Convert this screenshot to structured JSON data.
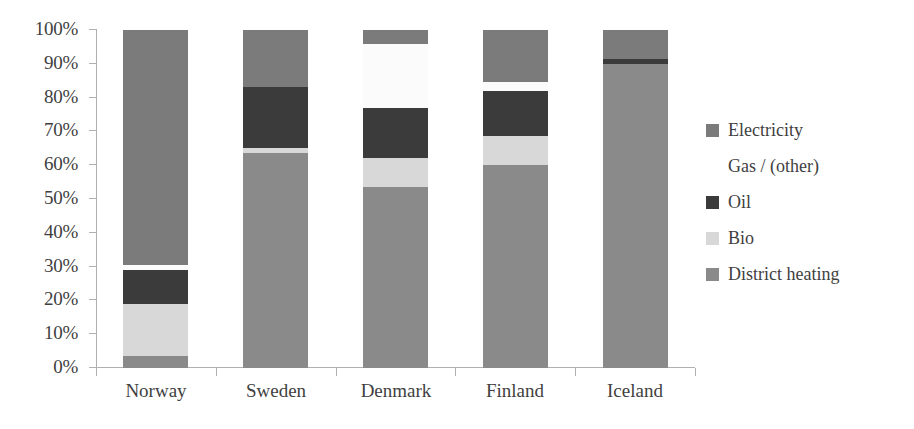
{
  "chart_data": {
    "type": "bar",
    "subtype": "stacked-percentage",
    "title": "",
    "subtitle": "",
    "xlabel": "",
    "ylabel": "",
    "ylim": [
      0,
      100
    ],
    "grid": false,
    "legend_position": "right",
    "categories": [
      "Norway",
      "Sweden",
      "Denmark",
      "Finland",
      "Iceland"
    ],
    "y_ticks": [
      "0%",
      "10%",
      "20%",
      "30%",
      "40%",
      "50%",
      "60%",
      "70%",
      "80%",
      "90%",
      "100%"
    ],
    "y_tick_values": [
      0,
      10,
      20,
      30,
      40,
      50,
      60,
      70,
      80,
      90,
      100
    ],
    "series": [
      {
        "name": "District heating",
        "color": "#8a8a8a",
        "values": [
          3.5,
          63.5,
          53.5,
          60.0,
          90.0
        ]
      },
      {
        "name": "Bio",
        "color": "#d8d8d8",
        "values": [
          15.5,
          1.5,
          8.5,
          8.5,
          0.0
        ]
      },
      {
        "name": "Oil",
        "color": "#3b3b3b",
        "values": [
          10.0,
          18.0,
          15.0,
          13.5,
          1.5
        ]
      },
      {
        "name": "Gas / (other)",
        "color": "#fbfbfb",
        "values": [
          1.5,
          0.0,
          19.0,
          2.5,
          0.0
        ]
      },
      {
        "name": "Electricity",
        "color": "#7b7b7b",
        "values": [
          69.5,
          17.0,
          4.0,
          15.5,
          8.5
        ]
      }
    ],
    "stack_order_bottom_to_top": [
      "District heating",
      "Bio",
      "Oil",
      "Gas / (other)",
      "Electricity"
    ]
  },
  "legend": {
    "items": [
      {
        "label": "Electricity",
        "color": "#7b7b7b",
        "has_swatch": true
      },
      {
        "label": "Gas / (other)",
        "color": "#ffffff",
        "has_swatch": false
      },
      {
        "label": "Oil",
        "color": "#3b3b3b",
        "has_swatch": true
      },
      {
        "label": "Bio",
        "color": "#d8d8d8",
        "has_swatch": true
      },
      {
        "label": "District heating",
        "color": "#8a8a8a",
        "has_swatch": true
      }
    ]
  },
  "axis": {
    "line_color": "#b0b0b0"
  }
}
